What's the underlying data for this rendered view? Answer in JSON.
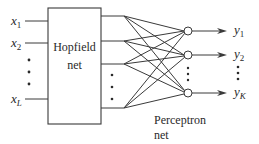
{
  "diagram": {
    "type": "block-diagram",
    "inputs": [
      {
        "name": "x",
        "sub": "1"
      },
      {
        "name": "x",
        "sub": "2"
      },
      {
        "name": "x",
        "sub": "L"
      }
    ],
    "outputs": [
      {
        "name": "y",
        "sub": "1"
      },
      {
        "name": "y",
        "sub": "2"
      },
      {
        "name": "y",
        "sub": "K"
      }
    ],
    "hopfield": {
      "line1": "Hopfield",
      "line2": "net"
    },
    "perceptron": {
      "line1": "Perceptron",
      "line2": "net"
    },
    "ellipsis": "⋮",
    "colors": {
      "stroke": "#3a3a3a",
      "text": "#2a2a2a",
      "background": "#ffffff"
    }
  }
}
